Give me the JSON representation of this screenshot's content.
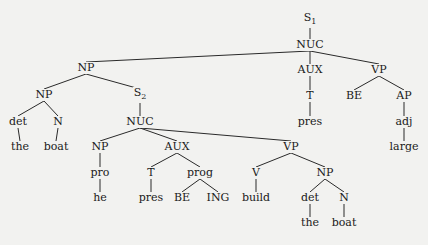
{
  "diagram": {
    "type": "syntax-tree",
    "nodes": [
      {
        "id": "S1",
        "label": "S",
        "sub": "1",
        "x": 310,
        "y": 20
      },
      {
        "id": "NUC1",
        "label": "NUC",
        "x": 310,
        "y": 45
      },
      {
        "id": "NP1",
        "label": "NP",
        "x": 86,
        "y": 68
      },
      {
        "id": "AUX1",
        "label": "AUX",
        "x": 310,
        "y": 70
      },
      {
        "id": "VP1",
        "label": "VP",
        "x": 379,
        "y": 70
      },
      {
        "id": "NP2",
        "label": "NP",
        "x": 44,
        "y": 95
      },
      {
        "id": "S2",
        "label": "S",
        "sub": "2",
        "x": 140,
        "y": 95
      },
      {
        "id": "T1",
        "label": "T",
        "x": 310,
        "y": 96
      },
      {
        "id": "BE1",
        "label": "BE",
        "x": 354,
        "y": 96
      },
      {
        "id": "AP1",
        "label": "AP",
        "x": 404,
        "y": 96
      },
      {
        "id": "det1",
        "label": "det",
        "x": 18,
        "y": 122
      },
      {
        "id": "N1",
        "label": "N",
        "x": 58,
        "y": 122
      },
      {
        "id": "NUC2",
        "label": "NUC",
        "x": 140,
        "y": 122
      },
      {
        "id": "pres1",
        "label": "pres",
        "x": 310,
        "y": 122
      },
      {
        "id": "adj1",
        "label": "adj",
        "x": 404,
        "y": 122
      },
      {
        "id": "the1",
        "label": "the",
        "x": 20,
        "y": 147
      },
      {
        "id": "boat1",
        "label": "boat",
        "x": 56,
        "y": 147
      },
      {
        "id": "NP3",
        "label": "NP",
        "x": 100,
        "y": 147
      },
      {
        "id": "AUX2",
        "label": "AUX",
        "x": 177,
        "y": 147
      },
      {
        "id": "VP2",
        "label": "VP",
        "x": 291,
        "y": 147
      },
      {
        "id": "large1",
        "label": "large",
        "x": 404,
        "y": 147
      },
      {
        "id": "pro1",
        "label": "pro",
        "x": 100,
        "y": 173
      },
      {
        "id": "T2",
        "label": "T",
        "x": 151,
        "y": 173
      },
      {
        "id": "prog1",
        "label": "prog",
        "x": 200,
        "y": 173
      },
      {
        "id": "V1",
        "label": "V",
        "x": 256,
        "y": 173
      },
      {
        "id": "NP4",
        "label": "NP",
        "x": 325,
        "y": 173
      },
      {
        "id": "he1",
        "label": "he",
        "x": 100,
        "y": 198
      },
      {
        "id": "pres2",
        "label": "pres",
        "x": 151,
        "y": 198
      },
      {
        "id": "BE2",
        "label": "BE",
        "x": 182,
        "y": 198
      },
      {
        "id": "ING1",
        "label": "ING",
        "x": 218,
        "y": 198
      },
      {
        "id": "build1",
        "label": "build",
        "x": 256,
        "y": 198
      },
      {
        "id": "det2",
        "label": "det",
        "x": 310,
        "y": 198
      },
      {
        "id": "N2",
        "label": "N",
        "x": 344,
        "y": 198
      },
      {
        "id": "the2",
        "label": "the",
        "x": 310,
        "y": 223
      },
      {
        "id": "boat2",
        "label": "boat",
        "x": 344,
        "y": 223
      }
    ],
    "edges": [
      [
        "S1",
        "NUC1"
      ],
      [
        "NUC1",
        "NP1"
      ],
      [
        "NUC1",
        "AUX1"
      ],
      [
        "NUC1",
        "VP1"
      ],
      [
        "NP1",
        "NP2"
      ],
      [
        "NP1",
        "S2"
      ],
      [
        "AUX1",
        "T1"
      ],
      [
        "T1",
        "pres1"
      ],
      [
        "VP1",
        "BE1"
      ],
      [
        "VP1",
        "AP1"
      ],
      [
        "AP1",
        "adj1"
      ],
      [
        "adj1",
        "large1"
      ],
      [
        "NP2",
        "det1"
      ],
      [
        "NP2",
        "N1"
      ],
      [
        "det1",
        "the1"
      ],
      [
        "N1",
        "boat1"
      ],
      [
        "S2",
        "NUC2"
      ],
      [
        "NUC2",
        "NP3"
      ],
      [
        "NUC2",
        "AUX2"
      ],
      [
        "NUC2",
        "VP2"
      ],
      [
        "NP3",
        "pro1"
      ],
      [
        "pro1",
        "he1"
      ],
      [
        "AUX2",
        "T2"
      ],
      [
        "AUX2",
        "prog1"
      ],
      [
        "T2",
        "pres2"
      ],
      [
        "prog1",
        "BE2"
      ],
      [
        "prog1",
        "ING1"
      ],
      [
        "VP2",
        "V1"
      ],
      [
        "VP2",
        "NP4"
      ],
      [
        "V1",
        "build1"
      ],
      [
        "NP4",
        "det2"
      ],
      [
        "NP4",
        "N2"
      ],
      [
        "det2",
        "the2"
      ],
      [
        "N2",
        "boat2"
      ]
    ]
  }
}
